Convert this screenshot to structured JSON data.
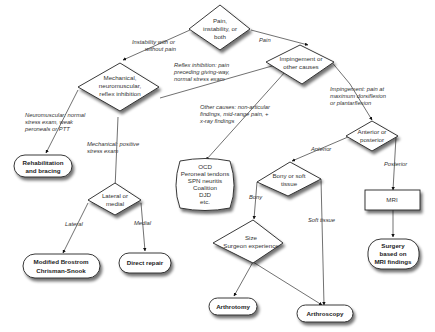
{
  "diagram": {
    "type": "flowchart",
    "decisions": {
      "root": [
        "Pain,",
        "instability, or",
        "both"
      ],
      "mechanical": [
        "Mechanical,",
        "neuromuscular,",
        "reflex inhibition"
      ],
      "impingement": [
        "Impingement or",
        "other causes"
      ],
      "lateral_medial": [
        "Lateral or",
        "medial"
      ],
      "anterior_posterior": [
        "Anterior or",
        "posterior"
      ],
      "bony_soft": [
        "Bony or soft",
        "tissue"
      ],
      "size_surgeon": [
        "Size",
        "Surgeon experience"
      ]
    },
    "terminals": {
      "rehab": [
        "Rehabilitation",
        "and bracing"
      ],
      "brostrom": [
        "Modified Brostrom",
        "Chrisman-Snook"
      ],
      "direct_repair": [
        "Direct repair"
      ],
      "other_dx": [
        "OCD",
        "Peroneal tendons",
        "SPN neuritis",
        "Coalition",
        "DJD",
        "etc."
      ],
      "surgery_mri": [
        "Surgery",
        "based on",
        "MRI findings"
      ],
      "arthrotomy": [
        "Arthrotomy"
      ],
      "arthroscopy": [
        "Arthroscopy"
      ]
    },
    "process": {
      "mri": "MRI"
    },
    "edge_labels": {
      "instability": [
        "Instability with or",
        "without pain"
      ],
      "pain": "Pain",
      "reflex": [
        "Reflex inhibition: pain",
        "preceding giving-way,",
        "normal stress exam"
      ],
      "neuromuscular": [
        "Neuromuscular: normal",
        "stress exam, weak",
        "peroneals or PTT"
      ],
      "mechanical_pos": [
        "Mechanical: positive",
        "stress exam"
      ],
      "other_causes": [
        "Other causes: non-articular",
        "findings, mid-range pain, +",
        "x-ray findings"
      ],
      "impingement_pain": [
        "Impingement: pain at",
        "maximum dorsiflexion",
        "or plantarflexion"
      ],
      "anterior": "Anterior",
      "posterior": "Posterior",
      "bony": "Bony",
      "soft_tissue": "Soft tissue",
      "lateral": "Lateral",
      "medial": "Medial"
    }
  }
}
